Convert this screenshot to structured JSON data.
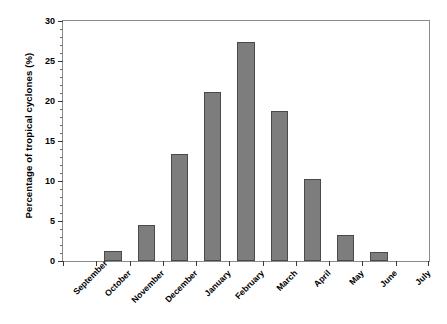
{
  "chart_data": {
    "type": "bar",
    "title": "",
    "subtitle": "",
    "xlabel": "",
    "ylabel": "Percentage of tropical cyclones (%)",
    "categories": [
      "September",
      "October",
      "November",
      "December",
      "January",
      "February",
      "March",
      "April",
      "May",
      "June",
      "July"
    ],
    "values": [
      0,
      1.2,
      4.5,
      13.4,
      21.1,
      27.4,
      18.8,
      10.2,
      3.3,
      1.1,
      0
    ],
    "series": [
      {
        "name": "Percentage of tropical cyclones",
        "values": [
          0,
          1.2,
          4.5,
          13.4,
          21.1,
          27.4,
          18.8,
          10.2,
          3.3,
          1.1,
          0
        ]
      }
    ],
    "ylim": [
      0,
      30
    ],
    "ytick_labels": [
      "0",
      "5",
      "10",
      "15",
      "20",
      "25",
      "30"
    ],
    "ytick_values": [
      0,
      5,
      10,
      15,
      20,
      25,
      30
    ],
    "yminor_step": 1,
    "grid": false,
    "legend": false,
    "legend_position": "none",
    "bar_color": "#7d7d7d",
    "bar_edge_color": "#4a4a4a",
    "axis_color": "#8a8a8a",
    "background_color": "#ffffff",
    "xtick_label_rotation": -45,
    "annotations": []
  }
}
